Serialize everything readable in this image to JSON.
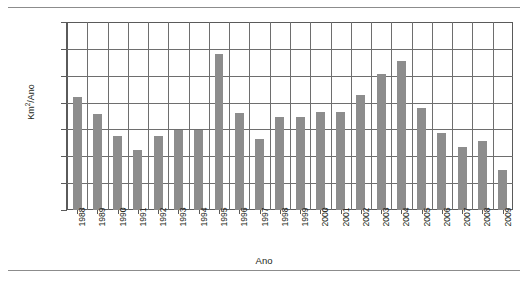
{
  "chart_data": {
    "type": "bar",
    "title": "",
    "xlabel": "Ano",
    "ylabel": "Km2/Ano",
    "ylabel_display": "Km²/Ano",
    "ylim": [
      0,
      35000
    ],
    "ytick_step": 5000,
    "yticks": [
      0,
      5000,
      10000,
      15000,
      20000,
      25000,
      30000,
      35000
    ],
    "ytick_labels": [
      "0",
      "5 000",
      "10 000",
      "15 000",
      "20 000",
      "25 000",
      "30 000",
      "35 000"
    ],
    "grid": true,
    "grid_axis": "both",
    "legend": false,
    "legend_position": "none",
    "bar_color": "#8d8d8d",
    "axis_color": "#5a5a5a",
    "grid_color": "#6e6e6e",
    "categories": [
      "1988",
      "1989",
      "1990",
      "1991",
      "1992",
      "1993",
      "1994",
      "1995",
      "1996",
      "1997",
      "1998",
      "1999",
      "2000",
      "2001",
      "2002",
      "2003",
      "2004",
      "2005",
      "2006",
      "2007",
      "2008",
      "2009"
    ],
    "values": [
      21000,
      17800,
      13700,
      11100,
      13800,
      14900,
      14900,
      29000,
      18100,
      13200,
      17400,
      17300,
      18200,
      18200,
      21500,
      25400,
      27800,
      19000,
      14300,
      11700,
      12900,
      7500
    ]
  },
  "figure": {
    "top_rule": true,
    "bottom_rule": true
  }
}
